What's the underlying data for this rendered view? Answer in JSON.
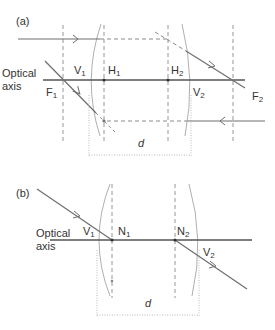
{
  "colors": {
    "ray": "#6e6e6e",
    "axis": "#555555",
    "dashed": "#8a8a8a",
    "lens": "#9a9a9a",
    "dotted": "#a8a8a8",
    "text": "#333333"
  },
  "panel_a": {
    "label": "(a)",
    "axis_label_line1": "Optical",
    "axis_label_line2": "axis",
    "points": {
      "v1": {
        "main": "V",
        "sub": "1"
      },
      "h1": {
        "main": "H",
        "sub": "1"
      },
      "h2": {
        "main": "H",
        "sub": "2"
      },
      "v2": {
        "main": "V",
        "sub": "2"
      },
      "f1": {
        "main": "F",
        "sub": "1"
      },
      "f2": {
        "main": "F",
        "sub": "2"
      }
    },
    "distance_label": "d"
  },
  "panel_b": {
    "label": "(b)",
    "axis_label_line1": "Optical",
    "axis_label_line2": "axis",
    "points": {
      "v1": {
        "main": "V",
        "sub": "1"
      },
      "n1": {
        "main": "N",
        "sub": "1"
      },
      "n2": {
        "main": "N",
        "sub": "2"
      },
      "v2": {
        "main": "V",
        "sub": "2"
      }
    },
    "distance_label": "d"
  }
}
